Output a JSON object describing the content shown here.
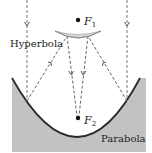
{
  "diagram": {
    "labels": {
      "hyperbola": "Hyperbola",
      "parabola": "Parabola",
      "focus1": "F",
      "focus1_sub": "1",
      "focus2": "F",
      "focus2_sub": "2"
    },
    "colors": {
      "background": "#ffffff",
      "parabola_fill": "#c2c2c2",
      "hyperbola_fill": "#d4d4d4",
      "curve_stroke": "#2a2a2a",
      "ray_stroke": "#555555",
      "text": "#222222"
    }
  }
}
